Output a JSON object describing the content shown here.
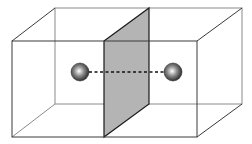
{
  "diagram": {
    "type": "3d-box-with-dividing-plane",
    "colors": {
      "background": "#ffffff",
      "edge_dark": "#3a3a3a",
      "edge_light": "#8a8a8a",
      "plane_fill": "#b4b4b4",
      "plane_edge": "#1a1a1a",
      "sphere_highlight": "#ffffff",
      "sphere_mid": "#8c8c8c",
      "sphere_dark": "#1e1e1e",
      "dash": "#111111"
    },
    "box": {
      "front_face": {
        "x1": 12,
        "y1": 41,
        "x2": 197,
        "y2": 137
      },
      "back_face": {
        "x1": 55,
        "y1": 8,
        "x2": 242,
        "y2": 104
      }
    },
    "plane": {
      "front_x": 104,
      "back_x": 149,
      "front_top": 41,
      "front_bottom": 137,
      "back_top": 8,
      "back_bottom": 104
    },
    "spheres": [
      {
        "name": "left-sphere",
        "cx": 80,
        "cy": 72,
        "r": 9
      },
      {
        "name": "right-sphere",
        "cx": 173,
        "cy": 72,
        "r": 9
      }
    ],
    "connector": {
      "x1": 89,
      "y1": 72,
      "x2": 164,
      "y2": 72,
      "style": "dashed"
    }
  }
}
